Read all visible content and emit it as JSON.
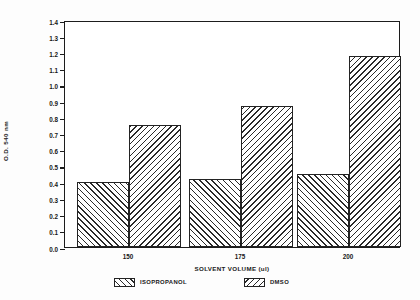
{
  "chart_data": {
    "type": "bar",
    "title": "",
    "xlabel": "SOLVENT VOLUME (ul)",
    "ylabel": "O.D. 540 nm",
    "categories": [
      "150",
      "175",
      "200"
    ],
    "series": [
      {
        "name": "ISOPROPANOL",
        "hatch": "forward",
        "values": [
          0.4,
          0.42,
          0.45
        ]
      },
      {
        "name": "DMSO",
        "hatch": "backward",
        "values": [
          0.75,
          0.87,
          1.18
        ]
      }
    ],
    "ylim": [
      0.0,
      1.4
    ],
    "ytick_step": 0.1,
    "yticks": [
      "1.4",
      "1.3",
      "1.2",
      "1.1",
      "1.0",
      "0.9",
      "0.8",
      "0.7",
      "0.6",
      "0.5",
      "0.4",
      "0.3",
      "0.2",
      "0.1",
      "0.0"
    ],
    "grid": false,
    "legend_position": "bottom",
    "legend": [
      "ISOPROPANOL",
      "DMSO"
    ],
    "colors": {
      "axis": "#1c1c1c",
      "hatch": "#2a2a2a",
      "background": "#ffffff",
      "text": "#161616"
    }
  }
}
